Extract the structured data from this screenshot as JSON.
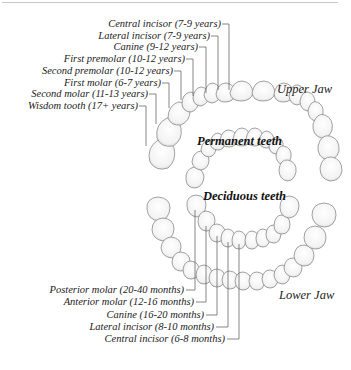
{
  "diagram": {
    "title_sections": {
      "permanent": "Permanent teeth",
      "deciduous": "Deciduous teeth"
    },
    "jaws": {
      "upper": "Upper Jaw",
      "lower": "Lower Jaw"
    },
    "permanent_labels": [
      {
        "label": "Central incisor (7-9 years)"
      },
      {
        "label": "Lateral incisor (7-9 years)"
      },
      {
        "label": "Canine (9-12 years)"
      },
      {
        "label": "First premolar (10-12 years)"
      },
      {
        "label": "Second premolar (10-12 years)"
      },
      {
        "label": "First molar (6-7 years)"
      },
      {
        "label": "Second molar (11-13 years)"
      },
      {
        "label": "Wisdom tooth (17+ years)"
      }
    ],
    "deciduous_labels": [
      {
        "label": "Posterior molar (20-40 months)"
      },
      {
        "label": "Anterior molar (12-16 months)"
      },
      {
        "label": "Canine (16-20 months)"
      },
      {
        "label": "Lateral incisor (8-10 months)"
      },
      {
        "label": "Central incisor (6-8 months)"
      }
    ],
    "colors": {
      "line": "#555555",
      "tooth_fill": "#fbfbfb",
      "tooth_stroke": "#8a8a8a",
      "text": "#222222"
    }
  }
}
